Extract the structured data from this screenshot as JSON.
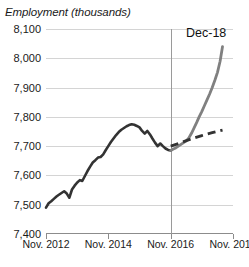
{
  "chart_data": {
    "type": "line",
    "title": "Employment (thousands)",
    "xlabel": "",
    "ylabel": "Employment (thousands)",
    "ylim": [
      7400,
      8100
    ],
    "ytick_values": [
      7400,
      7500,
      7600,
      7700,
      7800,
      7900,
      8000,
      8100
    ],
    "ytick_labels": [
      "7,400",
      "7,500",
      "7,600",
      "7,700",
      "7,800",
      "7,900",
      "8,000",
      "8,100"
    ],
    "xlim": [
      "Nov. 2012",
      "Nov. 2018"
    ],
    "xtick_labels": [
      "Nov. 2012",
      "Nov. 2014",
      "Nov. 2016",
      "Nov. 2018"
    ],
    "xtick_positions": [
      0.0,
      0.3333,
      0.6667,
      1.0
    ],
    "grid": "horizontal",
    "legend": "none",
    "annotations": [
      {
        "text": "Dec-18",
        "x": 0.93,
        "y": 8075
      }
    ],
    "reference_line": {
      "x": 0.6667,
      "label": "Nov. 2016",
      "color": "#9a9a9a"
    },
    "colors": {
      "historical": "#333333",
      "projection_actual": "#808080",
      "trend_dashed": "#333333",
      "gridline": "#d4d4d4",
      "axis": "#8c8c8c",
      "text": "#1a1a1a",
      "background": "#ffffff"
    },
    "series": [
      {
        "name": "Historical employment",
        "style": "solid",
        "color": "#333333",
        "x": [
          0.0,
          0.014,
          0.028,
          0.042,
          0.056,
          0.069,
          0.083,
          0.097,
          0.111,
          0.125,
          0.139,
          0.153,
          0.167,
          0.181,
          0.194,
          0.208,
          0.222,
          0.236,
          0.25,
          0.264,
          0.278,
          0.292,
          0.306,
          0.319,
          0.333,
          0.347,
          0.361,
          0.375,
          0.389,
          0.403,
          0.417,
          0.431,
          0.444,
          0.458,
          0.472,
          0.486,
          0.5,
          0.514,
          0.528,
          0.542,
          0.556,
          0.569,
          0.583,
          0.597,
          0.611,
          0.625,
          0.639,
          0.653,
          0.667
        ],
        "values": [
          7490,
          7505,
          7512,
          7520,
          7528,
          7534,
          7540,
          7546,
          7538,
          7524,
          7552,
          7565,
          7576,
          7584,
          7581,
          7598,
          7615,
          7630,
          7644,
          7652,
          7661,
          7663,
          7672,
          7686,
          7700,
          7714,
          7726,
          7738,
          7748,
          7756,
          7762,
          7768,
          7772,
          7775,
          7773,
          7769,
          7764,
          7752,
          7743,
          7752,
          7740,
          7726,
          7712,
          7700,
          7709,
          7700,
          7692,
          7687,
          7685
        ]
      },
      {
        "name": "Actual employment (post Nov. 2016)",
        "style": "solid",
        "color": "#808080",
        "x": [
          0.667,
          0.681,
          0.694,
          0.708,
          0.722,
          0.736,
          0.75,
          0.764,
          0.778,
          0.792,
          0.806,
          0.819,
          0.833,
          0.847,
          0.861,
          0.875,
          0.889,
          0.903,
          0.917,
          0.931,
          0.944
        ],
        "values": [
          7685,
          7690,
          7694,
          7700,
          7706,
          7712,
          7718,
          7728,
          7744,
          7762,
          7781,
          7800,
          7818,
          7838,
          7858,
          7878,
          7900,
          7925,
          7952,
          7990,
          8040
        ]
      },
      {
        "name": "Trend projection",
        "style": "dashed",
        "color": "#333333",
        "x": [
          0.667,
          0.722,
          0.778,
          0.833,
          0.889,
          0.944
        ],
        "values": [
          7700,
          7712,
          7725,
          7736,
          7746,
          7755
        ]
      }
    ]
  }
}
